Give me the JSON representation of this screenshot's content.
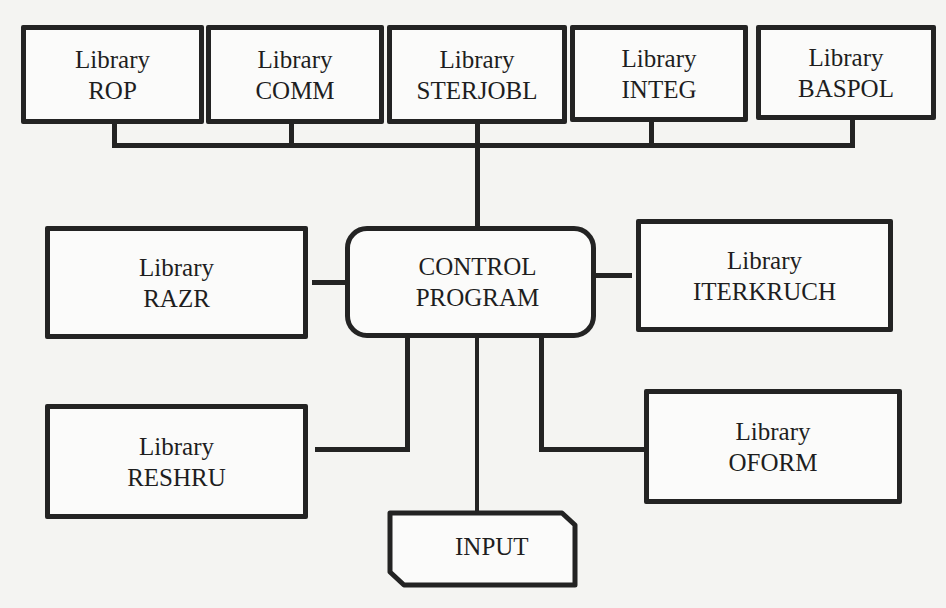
{
  "diagram": {
    "top_libraries": [
      {
        "line1": "Library",
        "line2": "ROP"
      },
      {
        "line1": "Library",
        "line2": "COMM"
      },
      {
        "line1": "Library",
        "line2": "STERJOBL"
      },
      {
        "line1": "Library",
        "line2": "INTEG"
      },
      {
        "line1": "Library",
        "line2": "BASPOL"
      }
    ],
    "control": {
      "line1": "CONTROL",
      "line2": "PROGRAM"
    },
    "left_libraries": [
      {
        "line1": "Library",
        "line2": "RAZR"
      },
      {
        "line1": "Library",
        "line2": "RESHRU"
      }
    ],
    "right_libraries": [
      {
        "line1": "Library",
        "line2": "ITERKRUCH"
      },
      {
        "line1": "Library",
        "line2": "OFORM"
      }
    ],
    "input": {
      "label": "INPUT"
    },
    "colors": {
      "stroke": "#232323",
      "background": "#f4f4f2",
      "box_fill": "#fbfbfa"
    }
  }
}
